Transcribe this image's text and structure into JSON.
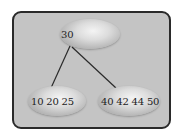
{
  "diagram": {
    "type": "b-tree",
    "root": {
      "keys": "30"
    },
    "children": [
      {
        "keys": "10 20 25"
      },
      {
        "keys": "40 42 44 50"
      }
    ],
    "colors": {
      "frame_bg": "#c4c4c4",
      "frame_border": "#2a2a2a",
      "edge": "#2a2a2a"
    }
  }
}
